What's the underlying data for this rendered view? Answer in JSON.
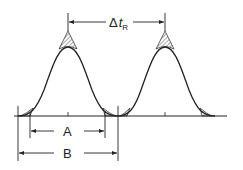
{
  "diagram": {
    "labels": {
      "delta_symbol": "Δ",
      "delta_t": "t",
      "delta_sub": "R",
      "width_a": "A",
      "width_b": "B"
    },
    "colors": {
      "line": "#222222",
      "background": "#ffffff"
    },
    "elements": {
      "peaks": 2,
      "retention_spacing_label": "Δt_R",
      "inner_width_label": "A",
      "outer_width_label": "B"
    }
  }
}
